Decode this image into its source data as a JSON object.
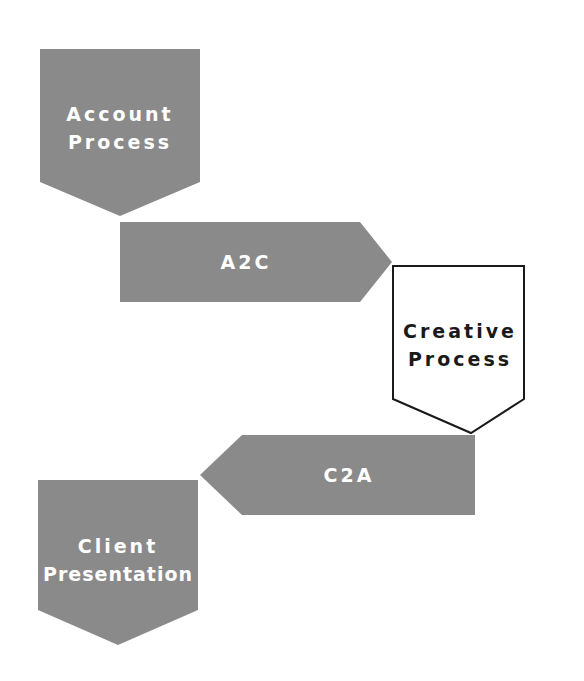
{
  "diagram": {
    "type": "process-flow",
    "colors": {
      "filled_shape": "#8a8a8a",
      "outline_shape_fill": "#ffffff",
      "outline_stroke": "#1a1a1a",
      "light_text": "#ffffff",
      "dark_text": "#1a1a1a",
      "background": "#ffffff"
    },
    "nodes": [
      {
        "id": "account-process",
        "shape": "pentagon-down",
        "style": "filled",
        "line1": "Account",
        "line2": "Process"
      },
      {
        "id": "a2c",
        "shape": "arrow-right",
        "style": "filled",
        "label": "A2C"
      },
      {
        "id": "creative-process",
        "shape": "pentagon-down",
        "style": "outlined",
        "line1": "Creative",
        "line2": "Process"
      },
      {
        "id": "c2a",
        "shape": "arrow-left",
        "style": "filled",
        "label": "C2A"
      },
      {
        "id": "client-presentation",
        "shape": "pentagon-down",
        "style": "filled",
        "line1": "Client",
        "line2": "Presentation"
      }
    ],
    "flow": [
      "Account Process",
      "A2C",
      "Creative Process",
      "C2A",
      "Client Presentation"
    ]
  }
}
